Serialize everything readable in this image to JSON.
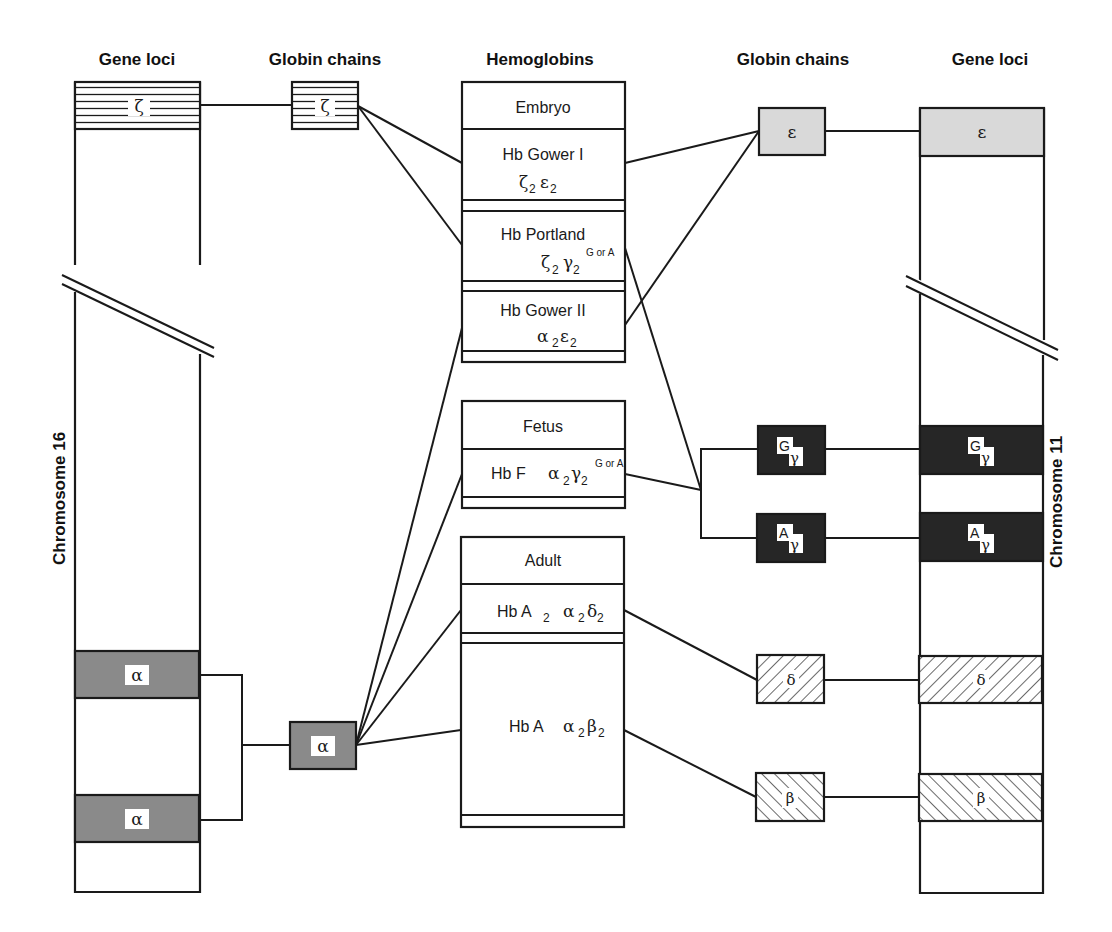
{
  "headers": {
    "left_gene_loci": "Gene loci",
    "left_globin_chains": "Globin chains",
    "hemoglobins": "Hemoglobins",
    "right_globin_chains": "Globin chains",
    "right_gene_loci": "Gene loci"
  },
  "chromosomes": {
    "left": "Chromosome 16",
    "right": "Chromosome 11"
  },
  "genes_chr16": [
    {
      "id": "zeta",
      "symbol": "ζ",
      "pattern": "horizontal-lines"
    },
    {
      "id": "alpha1",
      "symbol": "α",
      "pattern": "gray"
    },
    {
      "id": "alpha2",
      "symbol": "α",
      "pattern": "gray"
    }
  ],
  "genes_chr11": [
    {
      "id": "epsilon",
      "symbol": "ε",
      "pattern": "light-gray"
    },
    {
      "id": "Ggamma",
      "symbol": "γ",
      "superscript": "G",
      "pattern": "black"
    },
    {
      "id": "Agamma",
      "symbol": "γ",
      "superscript": "A",
      "pattern": "black"
    },
    {
      "id": "delta",
      "symbol": "δ",
      "pattern": "backslash-hatch"
    },
    {
      "id": "beta",
      "symbol": "β",
      "pattern": "slash-hatch"
    }
  ],
  "chains_left": [
    {
      "id": "zeta",
      "symbol": "ζ"
    },
    {
      "id": "alpha",
      "symbol": "α"
    }
  ],
  "chains_right": [
    {
      "id": "epsilon",
      "symbol": "ε"
    },
    {
      "id": "Ggamma",
      "symbol": "γ",
      "superscript": "G"
    },
    {
      "id": "Agamma",
      "symbol": "γ",
      "superscript": "A"
    },
    {
      "id": "delta",
      "symbol": "δ"
    },
    {
      "id": "beta",
      "symbol": "β"
    }
  ],
  "stages": [
    {
      "title": "Embryo",
      "hemoglobins": [
        {
          "name": "Hb Gower I",
          "formula": {
            "c1": "ζ",
            "s1": "2",
            "c2": "ε",
            "s2": "2"
          }
        },
        {
          "name": "Hb Portland",
          "formula": {
            "c1": "ζ",
            "s1": "2",
            "c2": "γ",
            "s2": "2",
            "sup": "G or A"
          }
        },
        {
          "name": "Hb Gower II",
          "formula": {
            "c1": "α",
            "s1": "2",
            "c2": "ε",
            "s2": "2"
          }
        }
      ]
    },
    {
      "title": "Fetus",
      "hemoglobins": [
        {
          "name": "Hb F",
          "formula": {
            "c1": "α",
            "s1": "2",
            "c2": "γ",
            "s2": "2",
            "sup": "G or A"
          }
        }
      ]
    },
    {
      "title": "Adult",
      "hemoglobins": [
        {
          "name": "Hb A",
          "name_sub": "2",
          "formula": {
            "c1": "α",
            "s1": "2",
            "c2": "δ",
            "s2": "2"
          }
        },
        {
          "name": "Hb A",
          "formula": {
            "c1": "α",
            "s1": "2",
            "c2": "β",
            "s2": "2"
          }
        }
      ]
    }
  ],
  "colors": {
    "line": "#1a1a1a",
    "alpha_gray": "#8a8a8a",
    "epsilon_gray": "#d9d9d9",
    "gamma_black": "#262626"
  }
}
